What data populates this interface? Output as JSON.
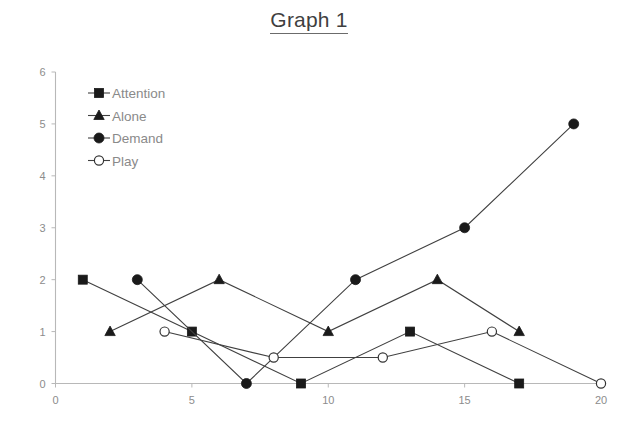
{
  "chart_data": {
    "type": "line",
    "title": "Graph 1",
    "xlabel": "",
    "ylabel": "",
    "xlim": [
      0,
      20
    ],
    "ylim": [
      0,
      6
    ],
    "xticks": [
      "0",
      "5",
      "10",
      "15",
      "20"
    ],
    "xtick_values": [
      0,
      5,
      10,
      15,
      20
    ],
    "yticks": [
      "0",
      "1",
      "2",
      "3",
      "4",
      "5",
      "6"
    ],
    "ytick_values": [
      0,
      1,
      2,
      3,
      4,
      5,
      6
    ],
    "grid": false,
    "legend_position": "upper-left-inside",
    "series": [
      {
        "name": "Attention",
        "marker": "filled-square",
        "x": [
          1,
          5,
          9,
          13,
          17
        ],
        "y": [
          2,
          1,
          0,
          1,
          0
        ],
        "points": [
          [
            1,
            2
          ],
          [
            5,
            1
          ],
          [
            9,
            0
          ],
          [
            13,
            1
          ],
          [
            17,
            0
          ]
        ]
      },
      {
        "name": "Alone",
        "marker": "filled-triangle",
        "x": [
          2,
          6,
          10,
          14,
          17
        ],
        "y": [
          1,
          2,
          1,
          2,
          1
        ],
        "points": [
          [
            2,
            1
          ],
          [
            6,
            2
          ],
          [
            10,
            1
          ],
          [
            14,
            2
          ],
          [
            17,
            1
          ]
        ]
      },
      {
        "name": "Demand",
        "marker": "filled-circle",
        "x": [
          3,
          7,
          11,
          15,
          19
        ],
        "y": [
          2,
          0,
          2,
          3,
          5
        ],
        "points": [
          [
            3,
            2
          ],
          [
            7,
            0
          ],
          [
            11,
            2
          ],
          [
            15,
            3
          ],
          [
            19,
            5
          ]
        ]
      },
      {
        "name": "Play",
        "marker": "open-circle",
        "x": [
          4,
          8,
          12,
          16,
          20
        ],
        "y": [
          1,
          0.5,
          0.5,
          1,
          0
        ],
        "points": [
          [
            4,
            1
          ],
          [
            8,
            0.5
          ],
          [
            12,
            0.5
          ],
          [
            16,
            1
          ],
          [
            20,
            0
          ]
        ]
      }
    ]
  },
  "colors": {
    "line": "#404040",
    "marker_fill": "#1a1a1a",
    "marker_open": "#ffffff",
    "axis": "#b8b8b8",
    "tick_text": "#8c8c8c",
    "legend_text": "#8a8a8a",
    "title_text": "#3f3f3f",
    "background": "#ffffff"
  }
}
